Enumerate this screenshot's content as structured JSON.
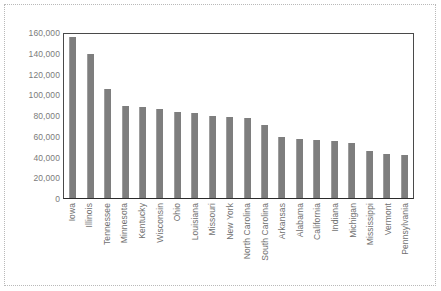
{
  "chart_data": {
    "type": "bar",
    "title": "",
    "xlabel": "",
    "ylabel": "",
    "ylim": [
      0,
      160000
    ],
    "y_ticks": [
      "0",
      "20,000",
      "40,000",
      "60,000",
      "80,000",
      "100,000",
      "120,000",
      "140,000",
      "160,000"
    ],
    "y_tick_values": [
      0,
      20000,
      40000,
      60000,
      80000,
      100000,
      120000,
      140000,
      160000
    ],
    "grid": false,
    "legend": "none",
    "bar_color": "#7e7e7e",
    "axis_color": "#4a4a4a",
    "categories": [
      "Iowa",
      "Illinois",
      "Tennessee",
      "Minnesota",
      "Kentucky",
      "Wisconsin",
      "Ohio",
      "Louisiana",
      "Missouri",
      "New York",
      "North Carolina",
      "South Carolina",
      "Arkansas",
      "Alabama",
      "California",
      "Indiana",
      "Michigan",
      "Mississippi",
      "Vermont",
      "Pennsylvania"
    ],
    "values": [
      155000,
      139000,
      105000,
      89000,
      88000,
      86000,
      83000,
      82000,
      79000,
      78000,
      77000,
      70000,
      59000,
      57000,
      56000,
      55000,
      53000,
      45000,
      42000,
      41000
    ]
  }
}
